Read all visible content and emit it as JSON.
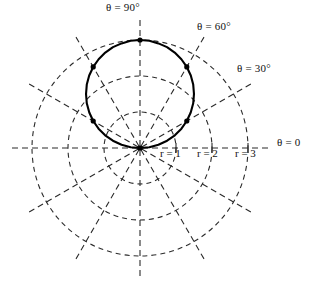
{
  "chart_data": {
    "type": "line",
    "subtype": "polar",
    "title": "",
    "equation": "r = 3 sin(theta)",
    "coordinate_system": "polar",
    "grid": true,
    "grid_style": "dashed",
    "legend": "none",
    "r_ticks": [
      1,
      2,
      3
    ],
    "r_tick_labels": [
      "r = 1",
      "r = 2",
      "r = 3"
    ],
    "rlim": [
      0,
      3
    ],
    "theta_ticks_deg": [
      0,
      30,
      60,
      90,
      120,
      150,
      180,
      210,
      240,
      270,
      300,
      330
    ],
    "theta_labels": [
      {
        "text": "θ = 0",
        "angle_deg": 0
      },
      {
        "text": "θ = 30°",
        "angle_deg": 30
      },
      {
        "text": "θ = 60°",
        "angle_deg": 60
      },
      {
        "text": "θ = 90°",
        "angle_deg": 90
      }
    ],
    "series": [
      {
        "name": "r = 3 sin(theta)",
        "color": "#000000",
        "marked_points": [
          {
            "theta_deg": 0,
            "r": 0.0
          },
          {
            "theta_deg": 30,
            "r": 1.5
          },
          {
            "theta_deg": 60,
            "r": 2.6
          },
          {
            "theta_deg": 90,
            "r": 3.0
          },
          {
            "theta_deg": 120,
            "r": 2.6
          },
          {
            "theta_deg": 150,
            "r": 1.5
          },
          {
            "theta_deg": 180,
            "r": 0.0
          }
        ],
        "points_theta_deg": [
          0,
          5,
          10,
          15,
          20,
          25,
          30,
          35,
          40,
          45,
          50,
          55,
          60,
          65,
          70,
          75,
          80,
          85,
          90,
          95,
          100,
          105,
          110,
          115,
          120,
          125,
          130,
          135,
          140,
          145,
          150,
          155,
          160,
          165,
          170,
          175,
          180
        ],
        "points_r": [
          0.0,
          0.26,
          0.52,
          0.78,
          1.03,
          1.27,
          1.5,
          1.72,
          1.93,
          2.12,
          2.3,
          2.46,
          2.6,
          2.72,
          2.82,
          2.9,
          2.95,
          2.99,
          3.0,
          2.99,
          2.95,
          2.9,
          2.82,
          2.72,
          2.6,
          2.46,
          2.3,
          2.12,
          1.93,
          1.72,
          1.5,
          1.27,
          1.03,
          0.78,
          0.52,
          0.26,
          0.0
        ]
      }
    ]
  },
  "labels": {
    "theta90": "θ = 90°",
    "theta60": "θ = 60°",
    "theta30": "θ = 30°",
    "theta0": "θ = 0",
    "r1": "r = 1",
    "r2": "r = 2",
    "r3": "r = 3"
  },
  "colors": {
    "curve": "#000000",
    "grid": "#2b2b2b",
    "background": "#ffffff",
    "text": "#111111"
  }
}
